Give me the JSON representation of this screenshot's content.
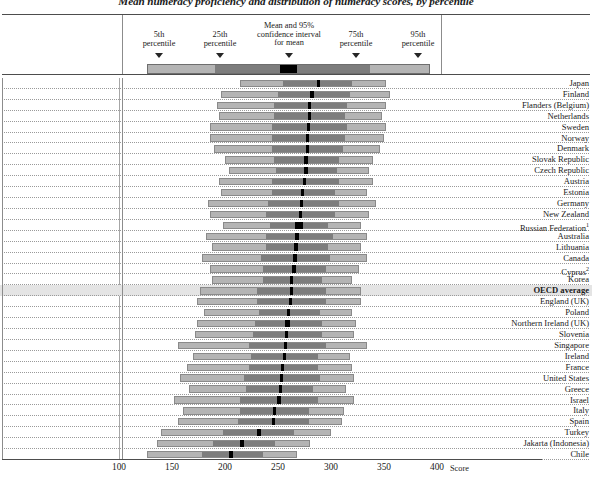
{
  "title": "Mean numeracy proficiency and distribution of numeracy scores, by percentile",
  "legend": {
    "items": [
      {
        "name": "p5",
        "line1": "5th",
        "line2": "percentile"
      },
      {
        "name": "p25",
        "line1": "25th",
        "line2": "percentile"
      },
      {
        "name": "mean",
        "line1": "Mean and 95%",
        "line2": "confidence interval",
        "line3": "for mean"
      },
      {
        "name": "p75",
        "line1": "75th",
        "line2": "percentile"
      },
      {
        "name": "p95",
        "line1": "95th",
        "line2": "percentile"
      }
    ]
  },
  "axis": {
    "label": "Score",
    "ticks": [
      "100",
      "150",
      "200",
      "250",
      "300",
      "350",
      "400"
    ],
    "min": 100,
    "max": 400,
    "step": 50
  },
  "colors": {
    "outer_band": "#b4b4b4",
    "inner_band": "#7d7d7d",
    "mean_marker": "#000000",
    "highlight_row": "#e4e4e4",
    "grid": "#a6a6a6",
    "frame": "#4d4d4d"
  },
  "chart_data": {
    "type": "bar",
    "subtype": "percentile-range-plot",
    "title": "Mean numeracy proficiency and distribution of numeracy scores, by percentile",
    "xlabel": "Score",
    "ylabel": "",
    "xlim": [
      100,
      400
    ],
    "grid": true,
    "legend_position": "top",
    "series_definition": [
      "p5",
      "p25",
      "ci_low",
      "mean",
      "ci_high",
      "p75",
      "p95"
    ],
    "categories": [
      "Japan",
      "Finland",
      "Flanders (Belgium)",
      "Netherlands",
      "Sweden",
      "Norway",
      "Denmark",
      "Slovak Republic",
      "Czech Republic",
      "Austria",
      "Estonia",
      "Germany",
      "New Zealand",
      "Russian Federation",
      "Australia",
      "Lithuania",
      "Canada",
      "Cyprus",
      "Korea",
      "OECD average",
      "England (UK)",
      "Poland",
      "Northern Ireland (UK)",
      "Slovenia",
      "Singapore",
      "Ireland",
      "France",
      "United States",
      "Greece",
      "Israel",
      "Italy",
      "Spain",
      "Turkey",
      "Jakarta (Indonesia)",
      "Chile"
    ],
    "rows": [
      {
        "label": "Japan",
        "sup": "",
        "bold": false,
        "highlight": false,
        "p5": 214,
        "p25": 254,
        "mean": 288,
        "ci": 1.2,
        "p75": 320,
        "p95": 352
      },
      {
        "label": "Finland",
        "sup": "",
        "bold": false,
        "highlight": false,
        "p5": 196,
        "p25": 250,
        "mean": 282,
        "ci": 1.5,
        "p75": 318,
        "p95": 356
      },
      {
        "label": "Flanders (Belgium)",
        "sup": "",
        "bold": false,
        "highlight": false,
        "p5": 192,
        "p25": 246,
        "mean": 280,
        "ci": 1.5,
        "p75": 316,
        "p95": 352
      },
      {
        "label": "Netherlands",
        "sup": "",
        "bold": false,
        "highlight": false,
        "p5": 194,
        "p25": 246,
        "mean": 280,
        "ci": 1.4,
        "p75": 314,
        "p95": 348
      },
      {
        "label": "Sweden",
        "sup": "",
        "bold": false,
        "highlight": false,
        "p5": 186,
        "p25": 244,
        "mean": 279,
        "ci": 1.6,
        "p75": 316,
        "p95": 352
      },
      {
        "label": "Norway",
        "sup": "",
        "bold": false,
        "highlight": false,
        "p5": 186,
        "p25": 244,
        "mean": 278,
        "ci": 1.6,
        "p75": 314,
        "p95": 350
      },
      {
        "label": "Denmark",
        "sup": "",
        "bold": false,
        "highlight": false,
        "p5": 190,
        "p25": 244,
        "mean": 278,
        "ci": 1.3,
        "p75": 312,
        "p95": 346
      },
      {
        "label": "Slovak Republic",
        "sup": "",
        "bold": false,
        "highlight": false,
        "p5": 200,
        "p25": 246,
        "mean": 276,
        "ci": 1.9,
        "p75": 308,
        "p95": 340
      },
      {
        "label": "Czech Republic",
        "sup": "",
        "bold": false,
        "highlight": false,
        "p5": 204,
        "p25": 248,
        "mean": 276,
        "ci": 1.9,
        "p75": 306,
        "p95": 336
      },
      {
        "label": "Austria",
        "sup": "",
        "bold": false,
        "highlight": false,
        "p5": 194,
        "p25": 244,
        "mean": 275,
        "ci": 1.4,
        "p75": 308,
        "p95": 340
      },
      {
        "label": "Estonia",
        "sup": "",
        "bold": false,
        "highlight": false,
        "p5": 196,
        "p25": 244,
        "mean": 273,
        "ci": 1.0,
        "p75": 304,
        "p95": 334
      },
      {
        "label": "Germany",
        "sup": "",
        "bold": false,
        "highlight": false,
        "p5": 184,
        "p25": 240,
        "mean": 272,
        "ci": 1.6,
        "p75": 308,
        "p95": 342
      },
      {
        "label": "New Zealand",
        "sup": "",
        "bold": false,
        "highlight": false,
        "p5": 186,
        "p25": 238,
        "mean": 271,
        "ci": 1.5,
        "p75": 304,
        "p95": 336
      },
      {
        "label": "Russian Federation",
        "sup": "1",
        "bold": false,
        "highlight": false,
        "p5": 198,
        "p25": 242,
        "mean": 270,
        "ci": 3.8,
        "p75": 298,
        "p95": 328
      },
      {
        "label": "Australia",
        "sup": "",
        "bold": false,
        "highlight": false,
        "p5": 182,
        "p25": 238,
        "mean": 268,
        "ci": 1.0,
        "p75": 302,
        "p95": 334
      },
      {
        "label": "Lithuania",
        "sup": "",
        "bold": false,
        "highlight": false,
        "p5": 188,
        "p25": 238,
        "mean": 267,
        "ci": 1.8,
        "p75": 298,
        "p95": 328
      },
      {
        "label": "Canada",
        "sup": "",
        "bold": false,
        "highlight": false,
        "p5": 178,
        "p25": 234,
        "mean": 266,
        "ci": 0.7,
        "p75": 300,
        "p95": 334
      },
      {
        "label": "Cyprus",
        "sup": "2",
        "bold": false,
        "highlight": false,
        "p5": 186,
        "p25": 236,
        "mean": 265,
        "ci": 1.7,
        "p75": 296,
        "p95": 326
      },
      {
        "label": "Korea",
        "sup": "",
        "bold": false,
        "highlight": false,
        "p5": 188,
        "p25": 236,
        "mean": 263,
        "ci": 0.7,
        "p75": 292,
        "p95": 320
      },
      {
        "label": "OECD average",
        "sup": "",
        "bold": true,
        "highlight": true,
        "p5": 176,
        "p25": 230,
        "mean": 263,
        "ci": 0.4,
        "p75": 296,
        "p95": 328
      },
      {
        "label": "England (UK)",
        "sup": "",
        "bold": false,
        "highlight": false,
        "p5": 174,
        "p25": 230,
        "mean": 262,
        "ci": 1.1,
        "p75": 296,
        "p95": 328
      },
      {
        "label": "Poland",
        "sup": "",
        "bold": false,
        "highlight": false,
        "p5": 180,
        "p25": 232,
        "mean": 260,
        "ci": 1.3,
        "p75": 290,
        "p95": 320
      },
      {
        "label": "Northern Ireland (UK)",
        "sup": "",
        "bold": false,
        "highlight": false,
        "p5": 174,
        "p25": 228,
        "mean": 259,
        "ci": 2.1,
        "p75": 292,
        "p95": 324
      },
      {
        "label": "Slovenia",
        "sup": "",
        "bold": false,
        "highlight": false,
        "p5": 172,
        "p25": 226,
        "mean": 258,
        "ci": 1.3,
        "p75": 292,
        "p95": 322
      },
      {
        "label": "Singapore",
        "sup": "",
        "bold": false,
        "highlight": false,
        "p5": 156,
        "p25": 222,
        "mean": 257,
        "ci": 1.0,
        "p75": 296,
        "p95": 334
      },
      {
        "label": "Ireland",
        "sup": "",
        "bold": false,
        "highlight": false,
        "p5": 170,
        "p25": 224,
        "mean": 256,
        "ci": 1.2,
        "p75": 288,
        "p95": 318
      },
      {
        "label": "France",
        "sup": "",
        "bold": false,
        "highlight": false,
        "p5": 164,
        "p25": 222,
        "mean": 254,
        "ci": 0.9,
        "p75": 288,
        "p95": 320
      },
      {
        "label": "United States",
        "sup": "",
        "bold": false,
        "highlight": false,
        "p5": 158,
        "p25": 218,
        "mean": 253,
        "ci": 1.4,
        "p75": 290,
        "p95": 322
      },
      {
        "label": "Greece",
        "sup": "",
        "bold": false,
        "highlight": false,
        "p5": 166,
        "p25": 220,
        "mean": 252,
        "ci": 1.4,
        "p75": 284,
        "p95": 314
      },
      {
        "label": "Israel",
        "sup": "",
        "bold": false,
        "highlight": false,
        "p5": 152,
        "p25": 214,
        "mean": 251,
        "ci": 1.6,
        "p75": 288,
        "p95": 322
      },
      {
        "label": "Italy",
        "sup": "",
        "bold": false,
        "highlight": false,
        "p5": 160,
        "p25": 214,
        "mean": 247,
        "ci": 1.5,
        "p75": 280,
        "p95": 312
      },
      {
        "label": "Spain",
        "sup": "",
        "bold": false,
        "highlight": false,
        "p5": 156,
        "p25": 212,
        "mean": 246,
        "ci": 1.2,
        "p75": 280,
        "p95": 310
      },
      {
        "label": "Turkey",
        "sup": "",
        "bold": false,
        "highlight": false,
        "p5": 140,
        "p25": 198,
        "mean": 232,
        "ci": 2.0,
        "p75": 266,
        "p95": 300
      },
      {
        "label": "Jakarta (Indonesia)",
        "sup": "",
        "bold": false,
        "highlight": false,
        "p5": 136,
        "p25": 188,
        "mean": 216,
        "ci": 1.4,
        "p75": 248,
        "p95": 280
      },
      {
        "label": "Chile",
        "sup": "",
        "bold": false,
        "highlight": false,
        "p5": 126,
        "p25": 178,
        "mean": 206,
        "ci": 1.8,
        "p75": 236,
        "p95": 268
      }
    ]
  }
}
